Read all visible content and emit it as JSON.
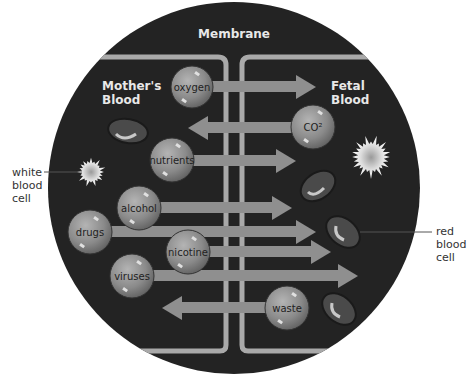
{
  "title": "Membrane",
  "regions": {
    "left": [
      "Mother's",
      "Blood"
    ],
    "right": [
      "Fetal",
      "Blood"
    ]
  },
  "callouts": {
    "white_blood_cell": [
      "white",
      "blood",
      "cell"
    ],
    "red_blood_cell": [
      "red",
      "blood",
      "cell"
    ]
  },
  "molecules": [
    {
      "label": "oxygen",
      "direction": "to-fetal"
    },
    {
      "label": "CO²",
      "direction": "to-mother"
    },
    {
      "label": "nutrients",
      "direction": "to-fetal"
    },
    {
      "label": "alcohol",
      "direction": "to-fetal"
    },
    {
      "label": "drugs",
      "direction": "to-fetal"
    },
    {
      "label": "nicotine",
      "direction": "to-fetal"
    },
    {
      "label": "viruses",
      "direction": "to-fetal"
    },
    {
      "label": "waste",
      "direction": "to-mother"
    }
  ],
  "colors": {
    "background_circle": "#222222",
    "membrane": "#a9a9a9",
    "arrow": "#8f8f8f",
    "molecule": "#8a8a8a"
  }
}
